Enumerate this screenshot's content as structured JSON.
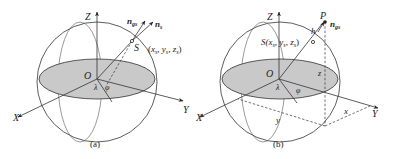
{
  "colors": {
    "equatorial_plane_fill": "#c9c9c9",
    "line": "#333333",
    "background": "#ffffff"
  },
  "panel_a": {
    "caption": "(a)",
    "axis_x": "X",
    "axis_y": "Y",
    "axis_z": "Z",
    "origin": "O",
    "angle_lambda": "λ",
    "angle_phi": "φ",
    "point_label": "S",
    "coords_open": "(",
    "coords_x": "x",
    "coords_x_sub": "s",
    "coords_sep1": ", ",
    "coords_y": "y",
    "coords_y_sub": "s",
    "coords_sep2": ", ",
    "coords_z": "z",
    "coords_z_sub": "s",
    "coords_close": ")",
    "vector_ngs": "n",
    "vector_ngs_sub": "gs",
    "vector_ns": "n",
    "vector_ns_sub": "s"
  },
  "panel_b": {
    "caption": "(b)",
    "axis_x": "X",
    "axis_y": "Y",
    "axis_z": "Z",
    "origin": "O",
    "angle_lambda": "λ",
    "angle_phi": "φ",
    "point_s_prefix": "S(",
    "coords_x": "x",
    "coords_x_sub": "s",
    "coords_y": "y",
    "coords_y_sub": "s",
    "coords_z": "z",
    "coords_z_sub": "s",
    "coords_sep": ", ",
    "coords_close": ")",
    "point_p": "P",
    "height_h": "h",
    "vector_ngs": "n",
    "vector_ngs_sub": "gs",
    "dim_x": "x",
    "dim_y": "y",
    "dim_z": "z"
  }
}
